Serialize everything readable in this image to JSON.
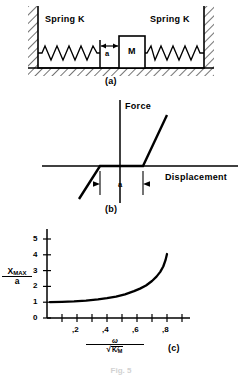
{
  "figure": {
    "panels": [
      {
        "id": "a",
        "caption": "(a)"
      },
      {
        "id": "b",
        "caption": "(b)"
      },
      {
        "id": "c",
        "caption": "(c)"
      }
    ],
    "bottom_note": "Fig. 5"
  },
  "panel_a": {
    "caption": "(a)",
    "spring_left_label": "Spring K",
    "spring_right_label": "Spring K",
    "mass_label": "M",
    "gap_label": "a"
  },
  "panel_b": {
    "caption": "(b)",
    "y_axis_label": "Force",
    "x_axis_label": "Displacement",
    "gap_label": "a"
  },
  "panel_c": {
    "caption": "(c)",
    "y_label_numerator": "X",
    "y_label_numerator_sub": "MAX",
    "y_label_denominator": "a",
    "x_label_numerator": "ω",
    "x_label_radical_num": "K",
    "x_label_radical_den": "M"
  },
  "chart_data": {
    "type": "line",
    "title": "",
    "xlabel": "ω / sqrt(K/M)",
    "ylabel": "X_MAX / a",
    "xlim": [
      0,
      0.92
    ],
    "ylim": [
      0,
      5.6
    ],
    "grid": false,
    "legend": false,
    "y_ticks": [
      0,
      1,
      2,
      3,
      4,
      5
    ],
    "y_tick_labels": [
      "0",
      "1",
      "2",
      "3",
      "4",
      "5"
    ],
    "x_ticks": [
      0.1,
      0.2,
      0.3,
      0.4,
      0.5,
      0.6,
      0.7,
      0.8,
      0.9
    ],
    "x_labeled_ticks": [
      0.2,
      0.4,
      0.6,
      0.8
    ],
    "x_tick_labels": [
      ",2",
      ",4",
      ",6",
      ",8"
    ],
    "series": [
      {
        "name": "X_MAX/a",
        "x": [
          0.02,
          0.1,
          0.18,
          0.26,
          0.34,
          0.4,
          0.46,
          0.52,
          0.58,
          0.62,
          0.66,
          0.7,
          0.73,
          0.755,
          0.775,
          0.79,
          0.8
        ],
        "y": [
          1.0,
          1.02,
          1.05,
          1.1,
          1.18,
          1.26,
          1.36,
          1.5,
          1.7,
          1.86,
          2.06,
          2.34,
          2.62,
          2.92,
          3.26,
          3.66,
          4.05
        ]
      }
    ]
  }
}
